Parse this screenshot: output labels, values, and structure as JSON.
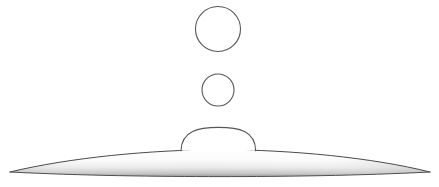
{
  "figure": {
    "name": "droplet-coalescence-diagram",
    "width": 439,
    "height": 187,
    "background_color": "#ffffff",
    "stroke_color": "#555555",
    "stroke_color_dark": "#3a3a3a",
    "fill_color": "#ffffff",
    "surface_gradient_top": "#ffffff",
    "surface_gradient_mid": "#f2f2f2",
    "surface_gradient_bottom": "#9a9a9a"
  },
  "shapes": {
    "upper_droplet": {
      "label": "upper-droplet",
      "type": "circle",
      "cx": 218,
      "cy": 29,
      "r": 22.5,
      "stroke_width": 1.1
    },
    "middle_droplet": {
      "label": "middle-droplet",
      "type": "circle",
      "cx": 218,
      "cy": 90,
      "r": 16,
      "stroke_width": 1.1
    },
    "sessile_drop": {
      "label": "sessile-drop",
      "type": "dome",
      "left_x": 181,
      "right_x": 256,
      "base_y": 150,
      "apex_y": 128,
      "stroke_width": 1.1,
      "path": "M 181 150 C 181.5 130.5 199 127.5 218.5 127.5 C 238.5 127.5 255.5 130.5 255.5 150"
    },
    "substrate_lens": {
      "label": "substrate-lens",
      "type": "lens",
      "left_tip_x": 10,
      "left_tip_y": 172,
      "right_tip_x": 430,
      "right_tip_y": 172,
      "apex_x": 220,
      "apex_y": 150,
      "stroke_width": 1.0,
      "top_path": "M 10 172 C 70 157.5 150 150 220 149.5 C 292 150 372 157.5 430 172",
      "bottom_path": "M 10 172 C 80 175.5 160 176.5 220 176.5 C 282 176.5 360 175.5 430 172"
    }
  }
}
